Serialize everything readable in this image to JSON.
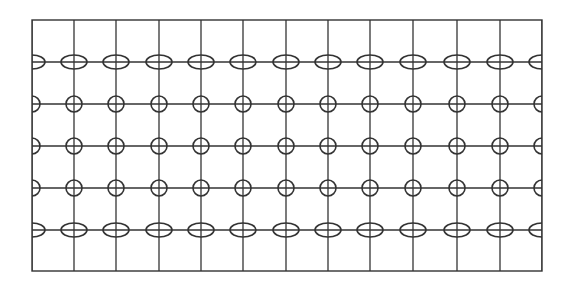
{
  "diagram": {
    "type": "grid-with-ellipse-markers",
    "frame": {
      "x": 32,
      "y": 20,
      "width": 510,
      "height": 251
    },
    "stroke_color": "#333333",
    "background": "#ffffff",
    "vertical_lines_x": [
      32,
      74,
      116,
      159,
      201,
      243,
      286,
      328,
      370,
      413,
      457,
      500,
      542
    ],
    "rows": [
      {
        "y": 62,
        "marker": "ellipse",
        "rx": 13,
        "ry": 7
      },
      {
        "y": 104,
        "marker": "circle",
        "rx": 8,
        "ry": 8
      },
      {
        "y": 146,
        "marker": "circle",
        "rx": 8,
        "ry": 8
      },
      {
        "y": 188,
        "marker": "circle",
        "rx": 8,
        "ry": 8
      },
      {
        "y": 230,
        "marker": "ellipse",
        "rx": 13,
        "ry": 7
      }
    ]
  }
}
